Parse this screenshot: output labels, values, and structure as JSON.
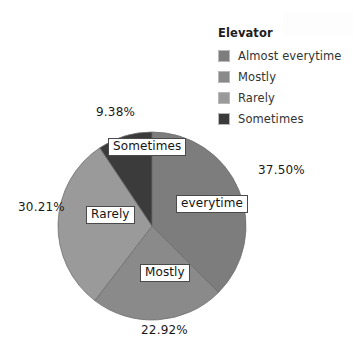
{
  "chart_data": {
    "type": "pie",
    "title": "",
    "legend_title": "Elevator",
    "legend_position": "top-right",
    "categories": [
      "Almost everytime",
      "Mostly",
      "Rarely",
      "Sometimes"
    ],
    "values": [
      37.5,
      22.92,
      30.21,
      9.38
    ],
    "value_labels": [
      "37.50%",
      "22.92%",
      "30.21%",
      "9.38%"
    ],
    "slice_labels": [
      "everytime",
      "Mostly",
      "Rarely",
      "Sometimes"
    ],
    "colors": [
      "#7d7d7d",
      "#8a8a8a",
      "#9a9a9a",
      "#3b3b3b"
    ],
    "start_angle_deg": 0,
    "direction": "clockwise",
    "grid": false,
    "xlabel": "",
    "ylabel": ""
  },
  "legend": {
    "title": "Elevator",
    "items": [
      {
        "label": "Almost everytime",
        "color": "#7d7d7d"
      },
      {
        "label": "Mostly",
        "color": "#8a8a8a"
      },
      {
        "label": "Rarely",
        "color": "#9a9a9a"
      },
      {
        "label": "Sometimes",
        "color": "#3b3b3b"
      }
    ]
  },
  "pie": {
    "callouts": {
      "top": "9.38%",
      "right": "37.50%",
      "left": "30.21%",
      "bottom": "22.92%"
    },
    "slice_labels": {
      "sometimes": "Sometimes",
      "everytime": "everytime",
      "rarely": "Rarely",
      "mostly": "Mostly"
    }
  },
  "geometry": {
    "center_x": 152,
    "center_y": 226,
    "radius": 94
  }
}
